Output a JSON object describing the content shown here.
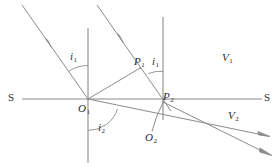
{
  "diagram": {
    "stroke_color": "#8c8c8c",
    "label_color": "#2b2b2b",
    "background": "#ffffff",
    "labels": {
      "source_left": "S",
      "source_right": "S",
      "origin_1": "O",
      "origin_1_sub": "1",
      "origin_2": "O",
      "origin_2_sub": "2",
      "point_1": "P",
      "point_1_sub": "1",
      "point_2": "P",
      "point_2_sub": "2",
      "angle_incidence_1": "i",
      "angle_incidence_1_sub": "1",
      "angle_incidence_2": "i",
      "angle_incidence_2_sub": "1",
      "angle_refraction": "i",
      "angle_refraction_sub": "2",
      "velocity_1": "V",
      "velocity_1_sub": "1",
      "velocity_2": "V",
      "velocity_2_sub": "2"
    },
    "geometry": {
      "boundary_line": {
        "x1": 22,
        "y1": 99,
        "x2": 262,
        "y2": 99
      },
      "normal_1": {
        "x1": 88,
        "y1": 28,
        "x2": 88,
        "y2": 162
      },
      "normal_2": {
        "x1": 163,
        "y1": 17,
        "x2": 163,
        "y2": 120
      },
      "incident_ray_1": {
        "x1": 22,
        "y1": 5,
        "x2": 88,
        "y2": 99
      },
      "incident_ray_2": {
        "x1": 97,
        "y1": 5,
        "x2": 170,
        "y2": 110
      },
      "wavefront_incident": {
        "x1": 88,
        "y1": 99,
        "x2": 140,
        "y2": 68
      },
      "wavefront_refracted": {
        "x1": 163,
        "y1": 102,
        "x2": 152,
        "y2": 132
      },
      "refracted_ray_1": {
        "x1": 88,
        "y1": 99,
        "x2": 270,
        "y2": 137
      },
      "refracted_ray_2": {
        "x1": 163,
        "y1": 102,
        "x2": 272,
        "y2": 156
      }
    },
    "points": {
      "O1": {
        "x": 88,
        "y": 99
      },
      "O2": {
        "x": 152,
        "y": 132
      },
      "P1": {
        "x": 140,
        "y": 68
      },
      "P2": {
        "x": 163,
        "y": 102
      }
    }
  }
}
